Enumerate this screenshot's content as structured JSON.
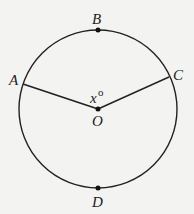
{
  "diagram": {
    "type": "circle-geometry",
    "center": {
      "label": "O",
      "x": 98,
      "y": 109
    },
    "radius": 79,
    "points": [
      {
        "label": "A",
        "x": 23,
        "y": 84
      },
      {
        "label": "B",
        "x": 98,
        "y": 30
      },
      {
        "label": "C",
        "x": 169,
        "y": 77
      },
      {
        "label": "D",
        "x": 98,
        "y": 188
      }
    ],
    "segments": [
      [
        "O",
        "A"
      ],
      [
        "O",
        "C"
      ]
    ],
    "angle_label": {
      "var": "x",
      "unit": "o"
    },
    "colors": {
      "stroke": "#222222",
      "background": "#f3f3f1"
    }
  }
}
